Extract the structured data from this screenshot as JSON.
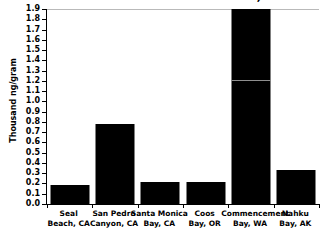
{
  "chart_data": {
    "type": "bar",
    "title": "for Selected Pacific Coast Estuaries, 1984",
    "xlabel": "",
    "ylabel": "Thousand ng/gram",
    "ylim": [
      0.0,
      1.9
    ],
    "ytick_step": 0.1,
    "grid": false,
    "legend": null,
    "bar_color": "#000000",
    "categories": [
      "Seal Beach, CA",
      "San Pedro Canyon, CA",
      "Santa Monica Bay, CA",
      "Coos Bay, OR",
      "Commencement Bay, WA",
      "Nahku Bay, AK"
    ],
    "category_lines": [
      [
        "Seal",
        "Beach, CA"
      ],
      [
        "San Pedro",
        "Canyon, CA"
      ],
      [
        "Santa Monica",
        "Bay, CA"
      ],
      [
        "Coos",
        "Bay, OR"
      ],
      [
        "Commencement",
        "Bay, WA"
      ],
      [
        "Nahku",
        "Bay, AK"
      ]
    ],
    "values": [
      0.19,
      0.78,
      0.21,
      0.21,
      1.95,
      0.33
    ],
    "value_notes": [
      "",
      "",
      "",
      "",
      "exceeds top of axis (clipped at 1.9)",
      ""
    ],
    "clipped_index": 4,
    "crossline_value": 1.2,
    "ytick_labels": [
      "0.0",
      "0.1",
      "0.2",
      "0.3",
      "0.4",
      "0.5",
      "0.6",
      "0.7",
      "0.8",
      "0.9",
      "1.0",
      "1.1",
      "1.2",
      "1.3",
      "1.4",
      "1.5",
      "1.6",
      "1.7",
      "1.8",
      "1.9"
    ],
    "ytick_values": [
      0.0,
      0.1,
      0.2,
      0.3,
      0.4,
      0.5,
      0.6,
      0.7,
      0.8,
      0.9,
      1.0,
      1.1,
      1.2,
      1.3,
      1.4,
      1.5,
      1.6,
      1.7,
      1.8,
      1.9
    ]
  }
}
